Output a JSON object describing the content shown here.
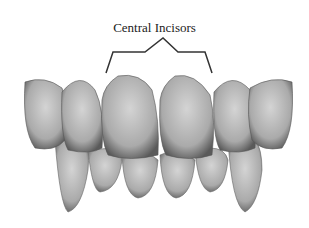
{
  "diagram": {
    "label": "Central Incisors",
    "colors": {
      "tooth": "#b8b8b8",
      "shadow": "#5a5a5a",
      "line": "#333333"
    }
  }
}
